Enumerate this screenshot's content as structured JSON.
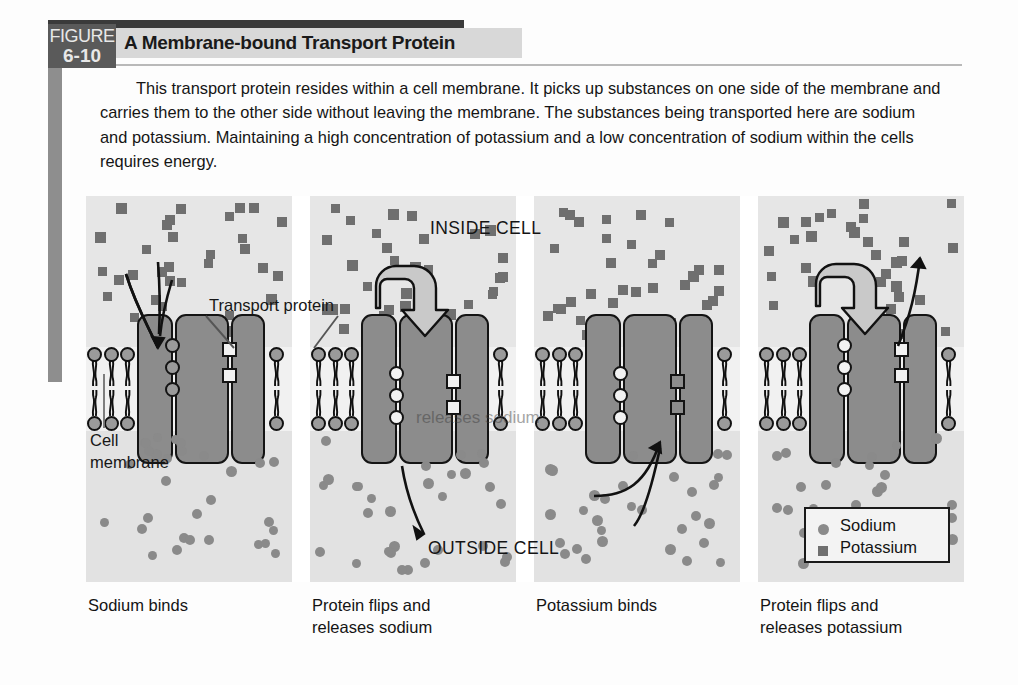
{
  "figure": {
    "badge_word": "FIGURE",
    "badge_number": "6-10",
    "title": "A Membrane-bound Transport Protein",
    "caption": "This transport protein resides within a cell membrane. It picks up substances on one side of the membrane and carries them to the other side without leaving the membrane. The substances being transported here are sodium and potassium. Maintaining a high concentration of potassium and a low concentration of sodium within the cells requires energy."
  },
  "diagram": {
    "region_labels": {
      "inside": "INSIDE CELL",
      "outside": "OUTSIDE CELL"
    },
    "annotations": {
      "transport_protein": "Transport protein",
      "cell_membrane_line1": "Cell",
      "cell_membrane_line2": "membrane",
      "ghost_text": "releases sodium"
    },
    "legend": {
      "items": [
        {
          "label": "Sodium",
          "shape": "circle",
          "color": "#8a8a8a"
        },
        {
          "label": "Potassium",
          "shape": "square",
          "color": "#6f6f6f"
        }
      ]
    },
    "panels": [
      {
        "id": "panel-1",
        "caption_line1": "Sodium binds",
        "caption_line2": ""
      },
      {
        "id": "panel-2",
        "caption_line1": "Protein flips and",
        "caption_line2": "releases sodium"
      },
      {
        "id": "panel-3",
        "caption_line1": "Potassium binds",
        "caption_line2": ""
      },
      {
        "id": "panel-4",
        "caption_line1": "Protein flips and",
        "caption_line2": "releases potassium"
      }
    ]
  },
  "colors": {
    "badge_bg": "#5a5a5a",
    "header_bar": "#d8d8d8",
    "protein": "#8c8c8c",
    "sodium": "#8a8a8a",
    "potassium": "#6f6f6f",
    "inside_bg": "#e6e6e6",
    "outside_bg": "#e2e2e2"
  }
}
